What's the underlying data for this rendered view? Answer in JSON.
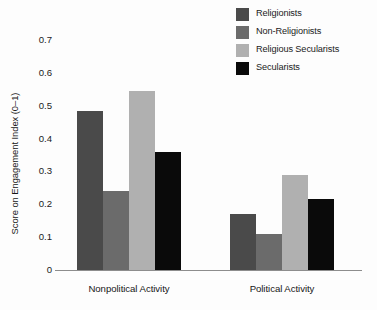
{
  "chart_data": {
    "type": "bar",
    "title": "",
    "subtitle": "",
    "xlabel": "",
    "ylabel": "Score on Engagement Index (0–1)",
    "categories": [
      "Nonpolitical Activity",
      "Political Activity"
    ],
    "series": [
      {
        "name": "Religionists",
        "color": "#4a4a4a",
        "values": [
          0.485,
          0.17
        ]
      },
      {
        "name": "Non-Religionists",
        "color": "#6b6b6b",
        "values": [
          0.24,
          0.11
        ]
      },
      {
        "name": "Religious Secularists",
        "color": "#b0b0b0",
        "values": [
          0.545,
          0.29
        ]
      },
      {
        "name": "Secularists",
        "color": "#0a0a0a",
        "values": [
          0.36,
          0.215
        ]
      }
    ],
    "ylim": [
      0,
      0.7
    ],
    "ytick_labels": [
      "0.7",
      "0.6",
      "0.5",
      "0.4",
      "0.3",
      "0.2",
      "0.1",
      "0"
    ],
    "ytick_values": [
      0.7,
      0.6,
      0.5,
      0.4,
      0.3,
      0.2,
      0.1,
      0
    ],
    "grid": false,
    "legend_position": "top-right",
    "axis_color": "#8d8d8d",
    "bar_group_gap": true
  },
  "legend": {
    "items": [
      {
        "label": "Religionists"
      },
      {
        "label": "Non-Religionists"
      },
      {
        "label": "Religious Secularists"
      },
      {
        "label": "Secularists"
      }
    ]
  },
  "axes": {
    "y_title": "Score on Engagement Index (0–1)",
    "x_categories": [
      "Nonpolitical Activity",
      "Political Activity"
    ]
  }
}
